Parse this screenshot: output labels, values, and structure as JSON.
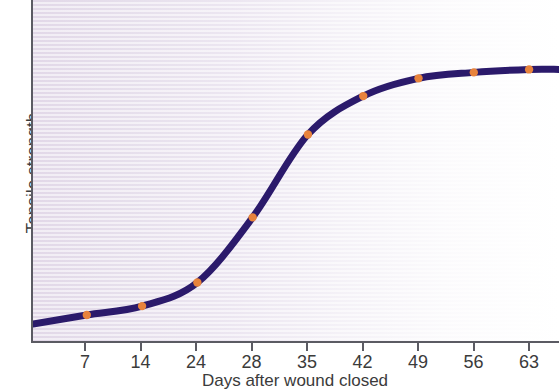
{
  "chart_data": {
    "type": "line",
    "title": "",
    "xlabel": "Days after wound closed",
    "ylabel": "Tensile strength",
    "grid": false,
    "legend": null,
    "xtick_labels": [
      "7",
      "14",
      "24",
      "28",
      "35",
      "42",
      "49",
      "56",
      "63"
    ],
    "x": [
      7,
      14,
      24,
      28,
      35,
      42,
      49,
      56,
      63
    ],
    "ytick_labels": [],
    "xlim": [
      0,
      70
    ],
    "ylim": [
      0,
      100
    ],
    "series": [
      {
        "name": "Tensile strength",
        "x": [
          7,
          14,
          24,
          28,
          35,
          42,
          49,
          56,
          63
        ],
        "values": [
          7,
          10,
          18,
          40,
          68,
          81,
          87,
          89,
          90
        ],
        "line_color": "#2b1a6b",
        "marker_color": "#e8833c",
        "marker": "circle"
      }
    ],
    "annotations": []
  },
  "axes": {
    "y_title": "Tensile strength",
    "x_title": "Days after wound closed",
    "tick_labels": [
      "7",
      "14",
      "24",
      "28",
      "35",
      "42",
      "49",
      "56",
      "63"
    ]
  },
  "colors": {
    "line": "#2b1a6b",
    "marker": "#e8833c",
    "marker_edge": "#c96a2b",
    "axis": "#5b5b63",
    "text": "#3b3b3b",
    "plot_bg_left": "#e2d8e8",
    "plot_bg_right": "#ffffff"
  }
}
